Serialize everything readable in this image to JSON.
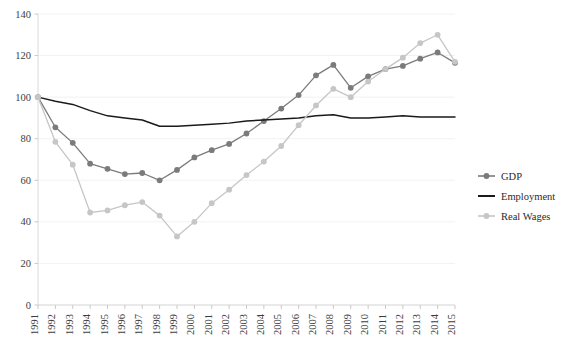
{
  "chart_data": {
    "type": "line",
    "title": "",
    "xlabel": "",
    "ylabel": "",
    "ylim": [
      0,
      140
    ],
    "ytick_step": 20,
    "grid": true,
    "legend_position": "right",
    "categories": [
      "1991",
      "1992",
      "1993",
      "1994",
      "1995",
      "1996",
      "1997",
      "1998",
      "1999",
      "2000",
      "2001",
      "2002",
      "2003",
      "2004",
      "2005",
      "2006",
      "2007",
      "2008",
      "2009",
      "2010",
      "2011",
      "2012",
      "2013",
      "2014",
      "2015"
    ],
    "yticks": [
      "0",
      "20",
      "40",
      "60",
      "80",
      "100",
      "120",
      "140"
    ],
    "series": [
      {
        "name": "GDP",
        "color": "#7b7b7b",
        "marker": "circle",
        "values": [
          100,
          85.5,
          78,
          68,
          65.5,
          63,
          63.5,
          60,
          65,
          71,
          74.5,
          77.5,
          82.5,
          88.5,
          94.5,
          101,
          110.5,
          115.5,
          104.5,
          110,
          113.5,
          115,
          118.5,
          121.5,
          116.5
        ]
      },
      {
        "name": "Employment",
        "color": "#1a1a1a",
        "marker": "none",
        "values": [
          100,
          98,
          96.5,
          93.5,
          91,
          90,
          89,
          86,
          86,
          86.5,
          87,
          87.5,
          88.5,
          89,
          89.5,
          90,
          91,
          91.5,
          90,
          90,
          90.5,
          91,
          90.5,
          90.5,
          90.5
        ]
      },
      {
        "name": "Real Wages",
        "color": "#c6c6c6",
        "marker": "circle",
        "values": [
          100,
          78.5,
          67.5,
          44.5,
          45.5,
          48,
          49.5,
          43,
          33,
          40,
          49,
          55.5,
          62.5,
          69,
          76.5,
          86.5,
          96,
          104,
          100,
          107.5,
          113.5,
          119,
          126,
          130,
          117
        ]
      }
    ]
  },
  "legend": {
    "items": [
      {
        "label": "GDP"
      },
      {
        "label": "Employment"
      },
      {
        "label": "Real Wages"
      }
    ]
  }
}
